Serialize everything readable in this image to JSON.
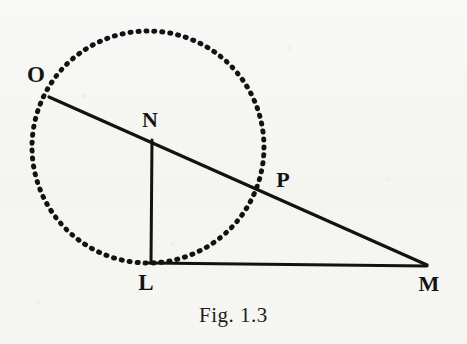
{
  "figure": {
    "caption": "Fig. 1.3",
    "background_color": "#f7f7f5",
    "ink_color": "#121212",
    "labels": {
      "O": "O",
      "N": "N",
      "P": "P",
      "L": "L",
      "M": "M"
    }
  },
  "chart_data": {
    "type": "diagram",
    "title": "Fig. 1.3",
    "subtitle": "",
    "xlabel": "",
    "ylabel": "",
    "coordinate_space": {
      "width": 467,
      "height": 344,
      "origin": "top-left",
      "units": "pixels"
    },
    "points": [
      {
        "name": "O",
        "x": 49,
        "y": 97,
        "label_x": 36,
        "label_y": 74,
        "on": "circle"
      },
      {
        "name": "N",
        "x": 152,
        "y": 140,
        "label_x": 150,
        "label_y": 120,
        "on": "line-OM"
      },
      {
        "name": "P",
        "x": 265,
        "y": 189,
        "label_x": 283,
        "label_y": 180,
        "on": "circle"
      },
      {
        "name": "L",
        "x": 150,
        "y": 263,
        "label_x": 146,
        "label_y": 282,
        "on": "circle-and-line-LM"
      },
      {
        "name": "M",
        "x": 427,
        "y": 265,
        "label_x": 429,
        "label_y": 284,
        "on": "line-LM"
      }
    ],
    "circle": {
      "name": "dotted-circle",
      "center_x": 148,
      "center_y": 147,
      "radius": 116,
      "style": "dotted",
      "stroke_width": 5,
      "dash_pattern": "1 7"
    },
    "segments": [
      {
        "name": "line-OM",
        "from": "O",
        "to": "M",
        "x1": 49,
        "y1": 97,
        "x2": 427,
        "y2": 265,
        "style": "solid",
        "stroke_width": 3.2
      },
      {
        "name": "line-NL",
        "from": "N",
        "to": "L",
        "x1": 152,
        "y1": 140,
        "x2": 151,
        "y2": 263,
        "style": "solid",
        "stroke_width": 3.0
      },
      {
        "name": "line-LM",
        "from": "L",
        "to": "M",
        "x1": 149,
        "y1": 263,
        "x2": 427,
        "y2": 266,
        "style": "solid",
        "stroke_width": 3.0
      }
    ],
    "legend": [],
    "grid": false
  }
}
